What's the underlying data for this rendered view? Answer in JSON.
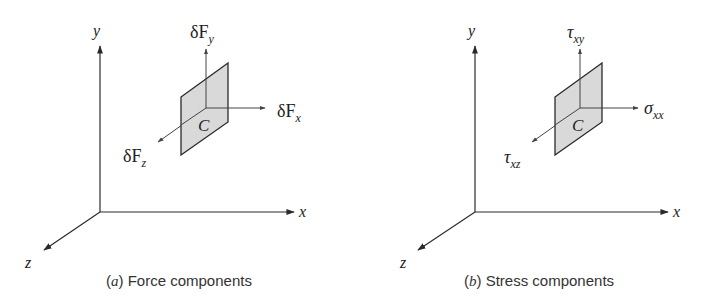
{
  "figure": {
    "panels": [
      {
        "id": "a",
        "caption_letter": "a",
        "caption_text": "Force components",
        "axes": {
          "x": "x",
          "y": "y",
          "z": "z"
        },
        "element_label": "C",
        "vectors": {
          "vertical": {
            "base": "δF",
            "sub": "y"
          },
          "horizontal": {
            "base": "δF",
            "sub": "x"
          },
          "oblique": {
            "base": "δF",
            "sub": "z"
          }
        }
      },
      {
        "id": "b",
        "caption_letter": "b",
        "caption_text": "Stress components",
        "axes": {
          "x": "x",
          "y": "y",
          "z": "z"
        },
        "element_label": "C",
        "vectors": {
          "vertical": {
            "base": "τ",
            "sub": "xy"
          },
          "horizontal": {
            "base": "σ",
            "sub": "xx"
          },
          "oblique": {
            "base": "τ",
            "sub": "xz"
          }
        }
      }
    ],
    "colors": {
      "line": "#2a2a2a",
      "plate_fill": "#d9d9d9",
      "background": "#ffffff"
    }
  }
}
